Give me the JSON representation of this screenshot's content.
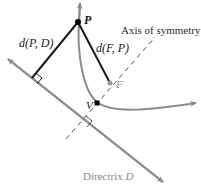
{
  "figure": {
    "labels": {
      "point_p": "P",
      "point_f": "F",
      "point_v": "V",
      "dist_pd": "d(P, D)",
      "dist_fp": "d(F, P)",
      "axis": "Axis of symmetry",
      "directrix_word": "Directrix",
      "directrix_symbol": "D"
    },
    "colors": {
      "segment": "#1a1a1a",
      "curve": "#8c8c8c",
      "directrix": "#8c8c8c",
      "axis": "#555555",
      "focus": "#9a9a9a",
      "vertex": "#000000"
    }
  }
}
